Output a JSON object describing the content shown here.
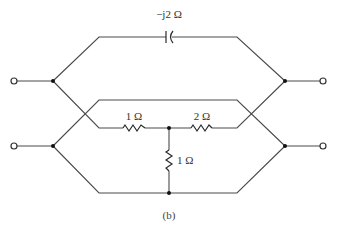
{
  "diagram": {
    "type": "circuit-schematic",
    "caption": "(b)",
    "components": {
      "capacitor": {
        "label": "−j2 Ω",
        "kind": "capacitor"
      },
      "resistor_left": {
        "label": "1 Ω",
        "kind": "resistor"
      },
      "resistor_right": {
        "label": "2 Ω",
        "kind": "resistor"
      },
      "resistor_vertical": {
        "label": "1 Ω",
        "kind": "resistor"
      }
    },
    "terminals": {
      "left_top": "input terminal",
      "left_bottom": "input terminal",
      "right_top": "output terminal",
      "right_bottom": "output terminal"
    },
    "colors": {
      "wire": "#4a4a4a",
      "node": "#111111",
      "background": "#ffffff"
    }
  }
}
